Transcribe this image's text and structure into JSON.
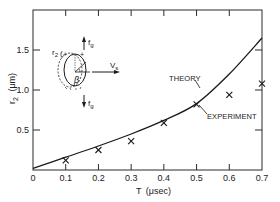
{
  "chart_data": {
    "type": "line",
    "title": "",
    "xlabel": "T (μsec)",
    "ylabel": "r2 (μm)",
    "xlim": [
      0,
      0.7
    ],
    "ylim": [
      0,
      2.0
    ],
    "x_ticks": [
      0,
      0.1,
      0.2,
      0.3,
      0.4,
      0.5,
      0.6,
      0.7
    ],
    "x_tick_labels": [
      "0",
      "0.1",
      "0.2",
      "0.3",
      "0.4",
      "0.5",
      "0.6",
      "0.7"
    ],
    "y_ticks": [
      0.5,
      1.0,
      1.5
    ],
    "y_tick_labels": [
      "0.5",
      "1.0",
      "1.5"
    ],
    "grid": false,
    "legend": null,
    "series": [
      {
        "name": "THEORY",
        "type": "line",
        "x": [
          0,
          0.1,
          0.2,
          0.3,
          0.4,
          0.5,
          0.6,
          0.7
        ],
        "values": [
          0.02,
          0.16,
          0.3,
          0.45,
          0.62,
          0.83,
          1.2,
          1.65
        ]
      },
      {
        "name": "EXPERIMENT",
        "type": "scatter",
        "marker": "x",
        "x": [
          0.1,
          0.2,
          0.3,
          0.4,
          0.5,
          0.6,
          0.7
        ],
        "values": [
          0.12,
          0.25,
          0.36,
          0.59,
          0.82,
          0.94,
          1.08
        ]
      }
    ],
    "annotations": [
      {
        "text": "THEORY",
        "points_to": "theory curve near T=0.48"
      },
      {
        "text": "EXPERIMENT",
        "points_to": "experiment marker at T=0.5"
      }
    ],
    "inset": {
      "description": "Droplet schematic: ellipse with dashed deformed outline, radius r2, angle β, upward force fg, downward force fg, velocity Vs to the right",
      "labels": {
        "radius": "r2",
        "angle": "β",
        "force_top": "fg",
        "force_bottom": "fg",
        "velocity": "Vs"
      }
    }
  },
  "labels": {
    "x_title_T": "T",
    "x_title_unit": "(μsec)",
    "y_title_r": "r",
    "y_title_sub": "2",
    "y_title_unit": "(μm)",
    "theory": "THEORY",
    "experiment": "EXPERIMENT",
    "inset_r": "r",
    "inset_r_sub": "2",
    "inset_beta": "β",
    "inset_fg_top": "f",
    "inset_fg_top_sub": "g",
    "inset_fg_bottom": "f",
    "inset_fg_bottom_sub": "g",
    "inset_vs": "V",
    "inset_vs_sub": "s",
    "plus": "+"
  },
  "colors": {
    "ink": "#1a1a1a",
    "background": "#ffffff"
  }
}
